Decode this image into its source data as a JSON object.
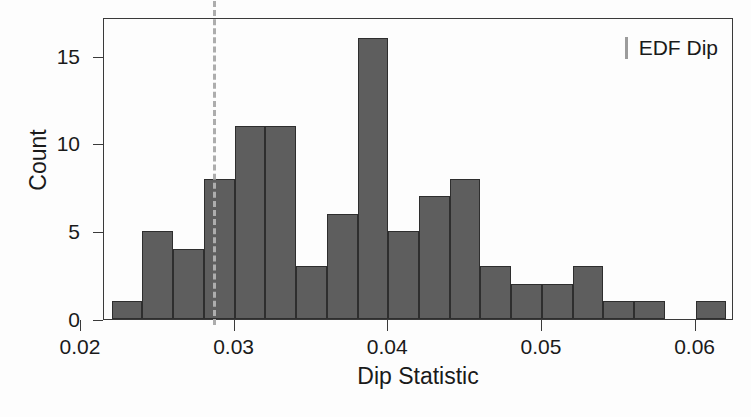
{
  "chart_data": {
    "type": "bar",
    "title": "",
    "subtitle": "",
    "xlabel": "Dip Statistic",
    "ylabel": "Count",
    "xlim": [
      0.0215,
      0.0625
    ],
    "ylim": [
      0,
      17.2
    ],
    "grid": false,
    "bin_width": 0.002,
    "bin_starts": [
      0.022,
      0.024,
      0.026,
      0.028,
      0.03,
      0.032,
      0.034,
      0.036,
      0.038,
      0.04,
      0.042,
      0.044,
      0.046,
      0.048,
      0.05,
      0.052,
      0.054,
      0.056,
      0.058,
      0.06
    ],
    "bin_ends": [
      0.024,
      0.026,
      0.028,
      0.03,
      0.032,
      0.034,
      0.036,
      0.038,
      0.04,
      0.042,
      0.044,
      0.046,
      0.048,
      0.05,
      0.052,
      0.054,
      0.056,
      0.058,
      0.06,
      0.062
    ],
    "categories": [
      "0.022-0.024",
      "0.024-0.026",
      "0.026-0.028",
      "0.028-0.030",
      "0.030-0.032",
      "0.032-0.034",
      "0.034-0.036",
      "0.036-0.038",
      "0.038-0.040",
      "0.040-0.042",
      "0.042-0.044",
      "0.044-0.046",
      "0.046-0.048",
      "0.048-0.050",
      "0.050-0.052",
      "0.052-0.054",
      "0.054-0.056",
      "0.056-0.058",
      "0.058-0.060",
      "0.060-0.062"
    ],
    "values": [
      1,
      5,
      4,
      8,
      11,
      11,
      3,
      6,
      16,
      5,
      7,
      8,
      3,
      2,
      2,
      3,
      1,
      1,
      0,
      1
    ],
    "xticks": [
      0.02,
      0.03,
      0.04,
      0.05,
      0.06
    ],
    "xticklabels": [
      "0.02",
      "0.03",
      "0.04",
      "0.05",
      "0.06"
    ],
    "yticks": [
      0,
      5,
      10,
      15
    ],
    "yticklabels": [
      "0",
      "5",
      "10",
      "15"
    ],
    "annotations": [
      {
        "name": "edf-dip-reference-line",
        "label": "EDF Dip",
        "x": 0.0286,
        "style": "dashed-vertical",
        "color": "#adadad"
      }
    ],
    "legend": {
      "position": "top-right",
      "entries": [
        {
          "label": "EDF Dip",
          "marker": "vertical-line",
          "color": "#9c9c9c"
        }
      ]
    },
    "colors": {
      "bar_fill": "#5e5e5e",
      "bar_edge": "#2e2e2e",
      "axis": "#3a3a3a",
      "reference_line": "#adadad",
      "background": "#fdfdfd",
      "text": "#1a1a1a"
    }
  }
}
